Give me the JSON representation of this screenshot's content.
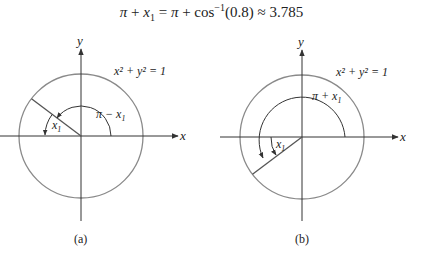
{
  "title": {
    "lhs_pi": "π",
    "plus1": " + ",
    "lhs_x": "x",
    "lhs_sub": "1",
    "equals": " = ",
    "rhs_pi": "π",
    "plus2": " + cos",
    "sup": "−1",
    "arg": "(0.8) ≈ 3.785"
  },
  "diagram_a": {
    "caption": "(a)",
    "axis_x_label": "x",
    "axis_y_label": "y",
    "circle_equation": "x² + y² = 1",
    "outer_angle_label": "π − x",
    "outer_angle_sub": "1",
    "inner_angle_label": "x",
    "inner_angle_sub": "1"
  },
  "diagram_b": {
    "caption": "(b)",
    "axis_x_label": "x",
    "axis_y_label": "y",
    "circle_equation": "x² + y² = 1",
    "outer_angle_label": "π + x",
    "outer_angle_sub": "1",
    "inner_angle_label": "x",
    "inner_angle_sub": "1"
  },
  "colors": {
    "circle": "#8a8a8a",
    "axes": "#333333",
    "text": "#222222"
  }
}
